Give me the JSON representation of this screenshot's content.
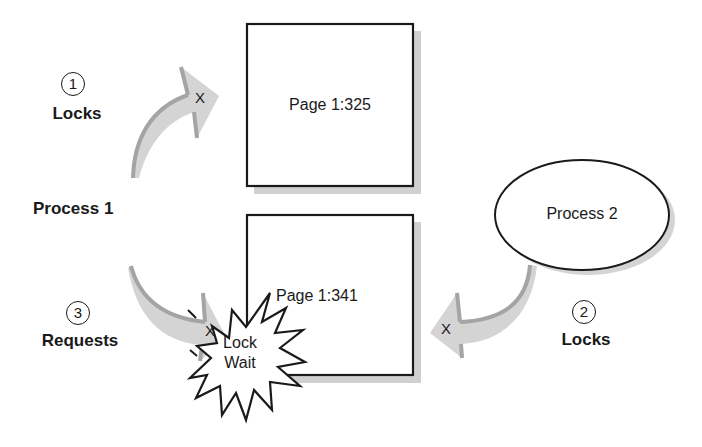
{
  "diagram": {
    "colors": {
      "stroke": "#1a1a1a",
      "arrow_fill": "#d2d2d2",
      "arrow_edge": "#a8a8a8",
      "shadow": "#cfcfcf",
      "background": "#ffffff"
    },
    "nodes": {
      "process1": {
        "label": "Process 1"
      },
      "process2": {
        "label": "Process 2"
      },
      "page_a": {
        "label": "Page 1:325"
      },
      "page_b": {
        "label": "Page 1:341"
      },
      "lock_wait": {
        "line1": "Lock",
        "line2": "Wait"
      }
    },
    "steps": [
      {
        "number": "1",
        "label": "Locks",
        "blocked_marker": "X"
      },
      {
        "number": "2",
        "label": "Locks",
        "blocked_marker": "X"
      },
      {
        "number": "3",
        "label": "Requests",
        "blocked_marker": "X"
      }
    ],
    "edges": [
      {
        "from": "Process 1",
        "to": "Page 1:325",
        "step": "1",
        "label": "Locks"
      },
      {
        "from": "Process 2",
        "to": "Page 1:341",
        "step": "2",
        "label": "Locks"
      },
      {
        "from": "Process 1",
        "to": "Page 1:341",
        "step": "3",
        "label": "Requests",
        "result": "Lock Wait"
      }
    ]
  }
}
